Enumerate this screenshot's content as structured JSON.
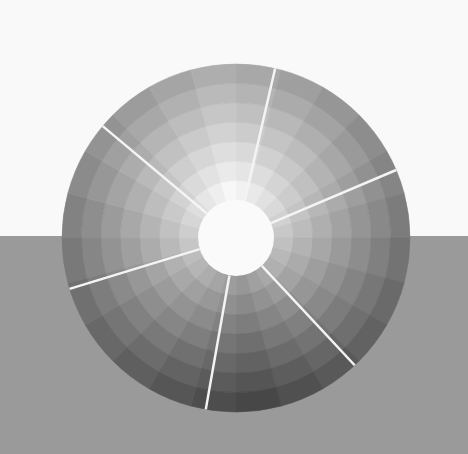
{
  "scene": {
    "description": "Grayscale tonal value wheel photographed on a split white/gray background",
    "background_top_color": "#f9f9f9",
    "background_bottom_color": "#9a9a9a",
    "horizon_y": 236
  },
  "wheel": {
    "center": [
      236,
      238
    ],
    "outer_radius_x": 174,
    "outer_radius_y": 174,
    "inner_radius": 38,
    "inner_fill": "#fafafa",
    "rings": 7,
    "segments": 24,
    "lightest_angle_deg": -95,
    "outer_edge_lightness": {
      "lightest": 175,
      "darkest": 70
    },
    "inner_edge_lightness": {
      "lightest": 248,
      "darkest": 150
    },
    "divider_color": "#f4f4f4",
    "divider_width": 2.5,
    "dividers_deg": [
      -77,
      -23,
      47,
      100,
      163,
      220
    ]
  }
}
